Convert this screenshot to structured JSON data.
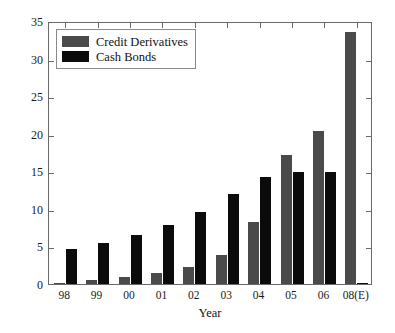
{
  "chart_data": {
    "type": "bar",
    "title": "",
    "xlabel": "Year",
    "ylabel": "Amount Outstanding (Trillion $)",
    "categories": [
      "98",
      "99",
      "00",
      "01",
      "02",
      "03",
      "04",
      "05",
      "06",
      "08(E)"
    ],
    "series": [
      {
        "name": "Credit Derivatives",
        "color": "#4a4a4a",
        "values": [
          0.2,
          0.6,
          0.9,
          1.4,
          2.2,
          3.8,
          8.2,
          17.2,
          20.4,
          33.5
        ]
      },
      {
        "name": "Cash Bonds",
        "color": "#0b0b0b",
        "values": [
          4.6,
          5.5,
          6.5,
          7.8,
          9.6,
          12.0,
          14.2,
          14.9,
          14.9,
          0.1
        ]
      }
    ],
    "ylim": [
      0,
      35
    ],
    "yticks": [
      0,
      5,
      10,
      15,
      20,
      25,
      30,
      35
    ],
    "ytick_labels": [
      "0",
      "5",
      "10",
      "15",
      "20",
      "25",
      "30",
      "35"
    ],
    "grid": false,
    "legend_position": "upper-left",
    "legend_entries": [
      "Credit Derivatives",
      "Cash Bonds"
    ],
    "axis_color": "#6a6a6a",
    "background": "#ffffff"
  }
}
